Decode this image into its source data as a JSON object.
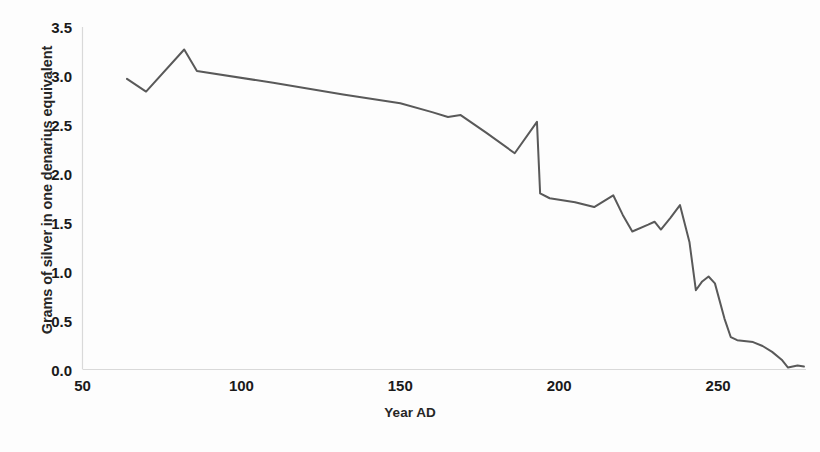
{
  "chart_data": {
    "type": "line",
    "title": "",
    "xlabel": "Year AD",
    "ylabel": "Grams of silver in one denarius equivalent",
    "xlim": [
      50,
      277
    ],
    "ylim": [
      0.0,
      3.5
    ],
    "grid": false,
    "legend": null,
    "axis": {
      "x_ticks": [
        "50",
        "100",
        "150",
        "200",
        "250"
      ],
      "x_tick_values": [
        50,
        100,
        150,
        200,
        250
      ],
      "y_ticks": [
        "0.0",
        "0.5",
        "1.0",
        "1.5",
        "2.0",
        "2.5",
        "3.0",
        "3.5"
      ],
      "y_tick_values": [
        0.0,
        0.5,
        1.0,
        1.5,
        2.0,
        2.5,
        3.0,
        3.5
      ]
    },
    "series": [
      {
        "name": "Silver content of the denarius",
        "color": "#595959",
        "line_width": 2.0,
        "x": [
          64,
          70,
          82,
          86,
          110,
          132,
          150,
          160,
          165,
          169,
          177,
          186,
          193,
          194,
          197,
          205,
          211,
          217,
          220,
          223,
          228,
          230,
          232,
          235,
          238,
          241,
          243,
          245,
          247,
          249,
          252,
          254,
          256,
          261,
          264,
          267,
          270,
          272,
          275,
          277
        ],
        "values": [
          2.97,
          2.84,
          3.27,
          3.05,
          2.93,
          2.81,
          2.72,
          2.63,
          2.58,
          2.6,
          2.42,
          2.21,
          2.53,
          1.8,
          1.75,
          1.71,
          1.66,
          1.78,
          1.58,
          1.41,
          1.48,
          1.51,
          1.43,
          1.55,
          1.68,
          1.3,
          0.81,
          0.9,
          0.95,
          0.88,
          0.52,
          0.33,
          0.3,
          0.28,
          0.24,
          0.18,
          0.1,
          0.02,
          0.04,
          0.03
        ]
      }
    ]
  },
  "axis_style": {
    "axis_line_color": "#d9d9d9",
    "plot_background": "#ffffff"
  }
}
